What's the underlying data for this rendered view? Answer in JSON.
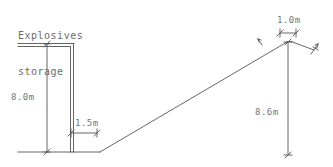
{
  "drawing": {
    "kind": "engineering-cross-section",
    "title_label": "Explosives\nstorage",
    "title_line1": "Explosives",
    "title_line2": "storage",
    "line_color": "#555555",
    "text_color": "#757575",
    "background_color": "#ffffff",
    "dimensions": [
      {
        "id": "wall-height",
        "label": "8.0m",
        "value": 8.0,
        "unit": "m",
        "orientation": "vertical",
        "describes": "storage-wall-height"
      },
      {
        "id": "wall-offset",
        "label": "1.5m",
        "value": 1.5,
        "unit": "m",
        "orientation": "horizontal",
        "describes": "wall-to-ramp-toe-offset"
      },
      {
        "id": "crest-width",
        "label": "1.0m",
        "value": 1.0,
        "unit": "m",
        "orientation": "horizontal",
        "describes": "barricade-crest-width"
      },
      {
        "id": "barricade-height",
        "label": "8.6m",
        "value": 8.6,
        "unit": "m",
        "orientation": "vertical",
        "describes": "barricade-total-height"
      }
    ]
  }
}
